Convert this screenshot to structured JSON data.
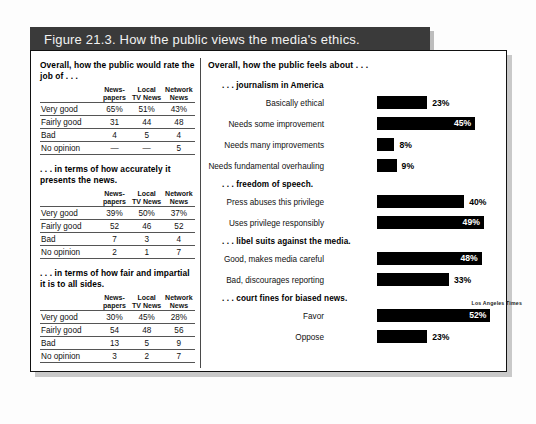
{
  "figure": {
    "title": "Figure 21.3.  How the public views the media's ethics.",
    "credit": "Los Angeles Times"
  },
  "left_panel": {
    "tables": [
      {
        "heading": "Overall, how the public would rate the job of . . .",
        "columns": [
          "",
          "News-\npapers",
          "Local\nTV News",
          "Network\nNews"
        ],
        "rows": [
          [
            "Very good",
            "65%",
            "51%",
            "43%"
          ],
          [
            "Fairly good",
            "31",
            "44",
            "48"
          ],
          [
            "Bad",
            "4",
            "5",
            "4"
          ],
          [
            "No opinion",
            "—",
            "—",
            "5"
          ]
        ]
      },
      {
        "heading": ". . . in terms of how accurately it presents the news.",
        "columns": [
          "",
          "News-\npapers",
          "Local\nTV News",
          "Network\nNews"
        ],
        "rows": [
          [
            "Very good",
            "39%",
            "50%",
            "37%"
          ],
          [
            "Fairly good",
            "52",
            "46",
            "52"
          ],
          [
            "Bad",
            "7",
            "3",
            "4"
          ],
          [
            "No opinion",
            "2",
            "1",
            "7"
          ]
        ]
      },
      {
        "heading": ". . . in terms of how fair and impartial it is to all sides.",
        "columns": [
          "",
          "News-\npapers",
          "Local\nTV News",
          "Network\nNews"
        ],
        "rows": [
          [
            "Very good",
            "30%",
            "45%",
            "28%"
          ],
          [
            "Fairly good",
            "54",
            "48",
            "56"
          ],
          [
            "Bad",
            "13",
            "5",
            "9"
          ],
          [
            "No opinion",
            "3",
            "2",
            "7"
          ]
        ]
      }
    ]
  },
  "right_panel": {
    "title": "Overall, how the public feels about . . ."
  },
  "chart_data": {
    "type": "bar",
    "title": "Overall, how the public feels about . . .",
    "orientation": "horizontal",
    "xlabel": "",
    "ylabel": "",
    "xlim": [
      0,
      55
    ],
    "grid": false,
    "legend": null,
    "value_suffix": "%",
    "groups": [
      {
        "name": ". . . journalism in America",
        "categories": [
          "Basically ethical",
          "Needs some improvement",
          "Needs many improvements",
          "Needs fundamental overhauling"
        ],
        "values": [
          23,
          45,
          8,
          9
        ],
        "labels": [
          "23%",
          "45%",
          "8%",
          "9%"
        ],
        "label_inside": [
          false,
          true,
          false,
          false
        ]
      },
      {
        "name": ". . . freedom of speech.",
        "categories": [
          "Press abuses this privilege",
          "Uses privilege responsibly"
        ],
        "values": [
          40,
          49
        ],
        "labels": [
          "40%",
          "49%"
        ],
        "label_inside": [
          false,
          true
        ]
      },
      {
        "name": ". . . libel suits against the media.",
        "categories": [
          "Good, makes media careful",
          "Bad, discourages reporting"
        ],
        "values": [
          48,
          33
        ],
        "labels": [
          "48%",
          "33%"
        ],
        "label_inside": [
          true,
          false
        ]
      },
      {
        "name": ". . . court fines for biased news.",
        "categories": [
          "Favor",
          "Oppose"
        ],
        "values": [
          52,
          23
        ],
        "labels": [
          "52%",
          "23%"
        ],
        "label_inside": [
          true,
          false
        ]
      }
    ]
  }
}
